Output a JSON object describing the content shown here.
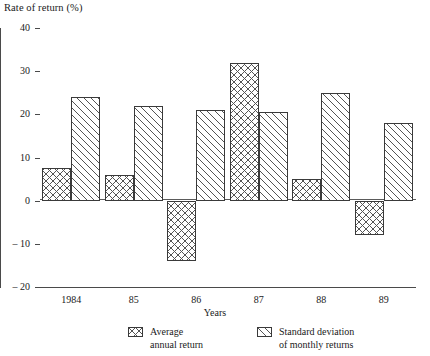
{
  "chart_data": {
    "type": "bar",
    "title": "Rate of return (%)",
    "xlabel": "Years",
    "ylabel": "Rate of return (%)",
    "categories": [
      "1984",
      "85",
      "86",
      "87",
      "88",
      "89"
    ],
    "series": [
      {
        "name": "Average annual return",
        "name_line1": "Average",
        "name_line2": "annual return",
        "pattern": "cross-hatch",
        "values": [
          7.5,
          6,
          -14,
          32,
          5,
          -8
        ]
      },
      {
        "name": "Standard deviation of monthly returns",
        "name_line1": "Standard deviation",
        "name_line2": "of monthly returns",
        "pattern": "diagonal-hatch",
        "values": [
          24,
          22,
          21,
          20.5,
          25,
          18
        ]
      }
    ],
    "ylim": [
      -20,
      40
    ],
    "yticks": [
      40,
      30,
      20,
      10,
      0,
      -10,
      -20
    ],
    "ytick_labels": [
      "40",
      "30",
      "20",
      "10",
      "0",
      "– 10",
      "– 20"
    ],
    "grid": false,
    "legend_position": "bottom",
    "zero_line": 0,
    "colors": {
      "axis": "#4a4a4a",
      "bar_outline": "#3a3a3a",
      "hatch": "#545454",
      "background": "#ffffff"
    }
  }
}
